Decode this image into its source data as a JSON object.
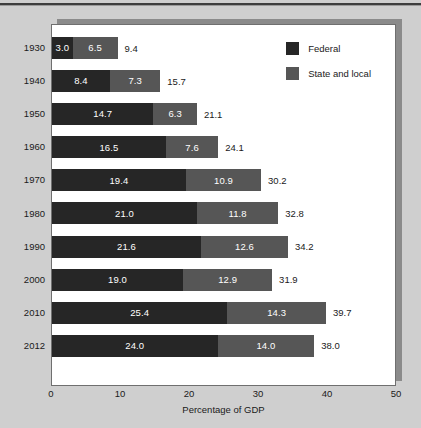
{
  "chart_data": {
    "type": "bar",
    "orientation": "horizontal",
    "stacked": true,
    "title": "",
    "xlabel": "Percentage of GDP",
    "ylabel": "",
    "xlim": [
      0,
      50
    ],
    "xticks": [
      0,
      10,
      20,
      30,
      40,
      50
    ],
    "xtick_labels": [
      "0",
      "10",
      "20",
      "30",
      "40",
      "50"
    ],
    "grid": false,
    "legend_position": "inside-top-right",
    "categories": [
      "1930",
      "1940",
      "1950",
      "1960",
      "1970",
      "1980",
      "1990",
      "2000",
      "2010",
      "2012"
    ],
    "series": [
      {
        "name": "Federal",
        "color": "#262626",
        "values": [
          3.0,
          8.4,
          14.7,
          16.5,
          19.4,
          21.0,
          21.6,
          19.0,
          25.4,
          24.0
        ],
        "value_labels": [
          "3.0",
          "8.4",
          "14.7",
          "16.5",
          "19.4",
          "21.0",
          "21.6",
          "19.0",
          "25.4",
          "24.0"
        ]
      },
      {
        "name": "State and local",
        "color": "#565656",
        "values": [
          6.5,
          7.3,
          6.3,
          7.6,
          10.9,
          11.8,
          12.6,
          12.9,
          14.3,
          14.0
        ],
        "value_labels": [
          "6.5",
          "7.3",
          "6.3",
          "7.6",
          "10.9",
          "11.8",
          "12.6",
          "12.9",
          "14.3",
          "14.0"
        ]
      }
    ],
    "totals": [
      9.4,
      15.7,
      21.1,
      24.1,
      30.2,
      32.8,
      34.2,
      31.9,
      39.7,
      38.0
    ],
    "total_labels": [
      "9.4",
      "15.7",
      "21.1",
      "24.1",
      "30.2",
      "32.8",
      "34.2",
      "31.9",
      "39.7",
      "38.0"
    ]
  },
  "legend": {
    "items": [
      {
        "label": "Federal",
        "color": "#262626"
      },
      {
        "label": "State and local",
        "color": "#565656"
      }
    ]
  },
  "axis": {
    "x_title": "Percentage of GDP",
    "ticks": [
      "0",
      "10",
      "20",
      "30",
      "40",
      "50"
    ]
  },
  "colors": {
    "federal": "#262626",
    "state_local": "#565656",
    "page_background": "#cfcfcf",
    "panel_background": "#ffffff",
    "panel_border": "#6f6f6f",
    "panel_shadow": "#8b8b8b",
    "text": "#1a1a1a",
    "inline_label_text": "#ffffff"
  },
  "footer": {
    "sliver_text": ""
  }
}
